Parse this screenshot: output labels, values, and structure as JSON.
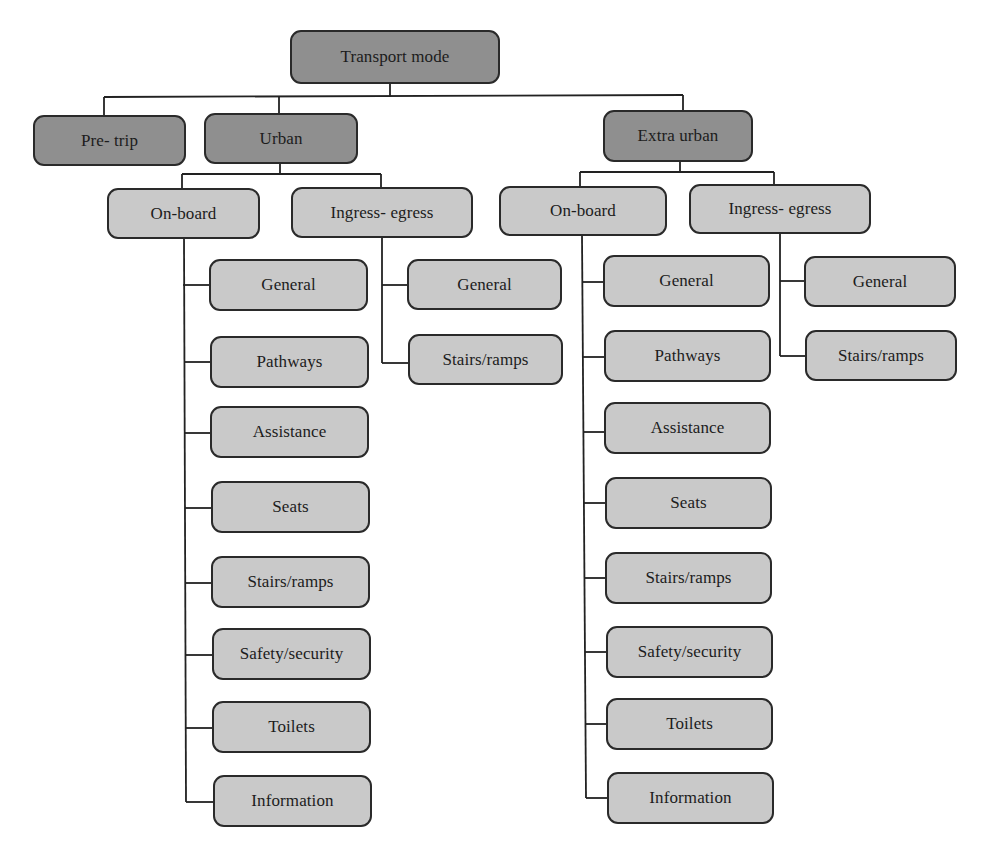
{
  "diagram": {
    "type": "tree",
    "colors": {
      "level_dark": "#8f8f8f",
      "level_light": "#c9c9c9",
      "border": "#2a2a2a",
      "line": "#222222"
    },
    "root": {
      "label": "Transport mode"
    },
    "level1": [
      {
        "label": "Pre- trip"
      },
      {
        "label": "Urban"
      },
      {
        "label": "Extra urban"
      }
    ],
    "urban": {
      "onboard": {
        "label": "On-board",
        "items": [
          "General",
          "Pathways",
          "Assistance",
          "Seats",
          "Stairs/ramps",
          "Safety/security",
          "Toilets",
          "Information"
        ]
      },
      "ingress": {
        "label": "Ingress- egress",
        "items": [
          "General",
          "Stairs/ramps"
        ]
      }
    },
    "extra_urban": {
      "onboard": {
        "label": "On-board",
        "items": [
          "General",
          "Pathways",
          "Assistance",
          "Seats",
          "Stairs/ramps",
          "Safety/security",
          "Toilets",
          "Information"
        ]
      },
      "ingress": {
        "label": "Ingress- egress",
        "items": [
          "General",
          "Stairs/ramps"
        ]
      }
    }
  }
}
